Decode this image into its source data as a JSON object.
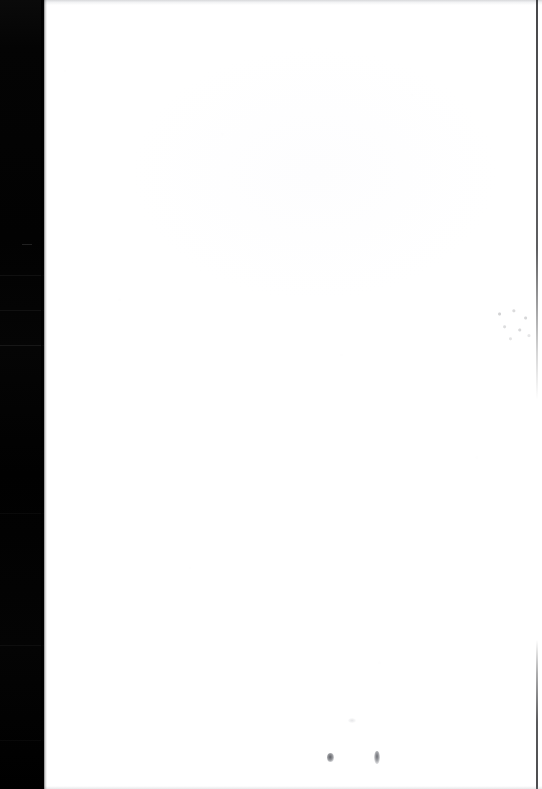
{
  "document": {
    "kind": "scanned-page",
    "page_label": "",
    "body_text": "",
    "visible_text": "",
    "orientation": "portrait",
    "width_px": 542,
    "height_px": 789
  },
  "colors": {
    "paper": "#ffffff",
    "gutter": "#030303",
    "edge_line": "#191a1c",
    "ink_mark": "#55575d",
    "speckle": "#5a5c62",
    "top_edge_haze": "#787c84"
  },
  "regions": {
    "gutter_strip": {
      "name": "scanner-gutter",
      "left_px": 0,
      "top_px": 0,
      "width_px": 44,
      "height_px": 789,
      "note": ""
    },
    "paper_surface": {
      "name": "page-surface",
      "left_px": 44,
      "top_px": 0,
      "width_px": 498,
      "height_px": 789,
      "note": ""
    }
  },
  "artifacts": [
    {
      "name": "gutter-seam-1",
      "top_px": 275
    },
    {
      "name": "gutter-seam-2",
      "top_px": 310
    },
    {
      "name": "gutter-seam-3",
      "top_px": 345
    },
    {
      "name": "gutter-seam-4",
      "top_px": 513
    },
    {
      "name": "gutter-seam-5",
      "top_px": 645
    },
    {
      "name": "gutter-seam-6",
      "top_px": 740
    },
    {
      "name": "ink-mark-left",
      "left_px": 330,
      "top_px": 758
    },
    {
      "name": "ink-mark-right",
      "left_px": 377,
      "top_px": 758
    },
    {
      "name": "speckle-cluster",
      "left_px": 492,
      "top_px": 306
    }
  ]
}
